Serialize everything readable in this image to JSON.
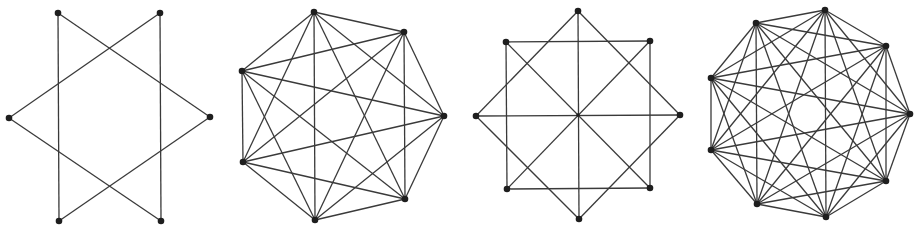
{
  "figure": {
    "width": 921,
    "height": 226,
    "colors": {
      "edge": "#3a3a3a",
      "vertex": "#1e1e1e",
      "background": "#ffffff"
    },
    "graphs": [
      {
        "name": "hexagram",
        "description": "Star of David: two overlapping triangles on 6 vertices",
        "vertices": [
          [
            58,
            13
          ],
          [
            160,
            13
          ],
          [
            210,
            117
          ],
          [
            161,
            221
          ],
          [
            59,
            221
          ],
          [
            9,
            118
          ]
        ],
        "edges": [
          [
            0,
            2
          ],
          [
            2,
            4
          ],
          [
            4,
            0
          ],
          [
            1,
            3
          ],
          [
            3,
            5
          ],
          [
            5,
            1
          ]
        ]
      },
      {
        "name": "k7-complete-graph",
        "description": "Complete graph on 7 vertices",
        "vertices": [
          [
            314,
            12
          ],
          [
            404,
            32
          ],
          [
            444,
            116
          ],
          [
            405,
            199
          ],
          [
            315,
            220
          ],
          [
            243,
            162
          ],
          [
            242,
            71
          ]
        ],
        "complete": true
      },
      {
        "name": "octagram-with-diameters",
        "description": "Square and rotated square on 8 vertices with 4 diameters through center",
        "vertices": [
          [
            578,
            11
          ],
          [
            650,
            41
          ],
          [
            680,
            115
          ],
          [
            650,
            188
          ],
          [
            579,
            219
          ],
          [
            507,
            189
          ],
          [
            476,
            116
          ],
          [
            506,
            42
          ]
        ],
        "edges": [
          [
            7,
            1
          ],
          [
            1,
            3
          ],
          [
            3,
            5
          ],
          [
            5,
            7
          ],
          [
            0,
            2
          ],
          [
            2,
            4
          ],
          [
            4,
            6
          ],
          [
            6,
            0
          ],
          [
            0,
            4
          ],
          [
            2,
            6
          ],
          [
            7,
            3
          ],
          [
            1,
            5
          ]
        ],
        "center_dot": [
          578,
          115
        ]
      },
      {
        "name": "k9-complete-graph",
        "description": "Complete graph on 9 vertices",
        "vertices": [
          [
            825,
            10
          ],
          [
            886,
            46
          ],
          [
            910,
            114
          ],
          [
            886,
            181
          ],
          [
            826,
            217
          ],
          [
            757,
            204
          ],
          [
            711,
            150
          ],
          [
            711,
            78
          ],
          [
            756,
            23
          ]
        ],
        "complete": true
      }
    ]
  }
}
